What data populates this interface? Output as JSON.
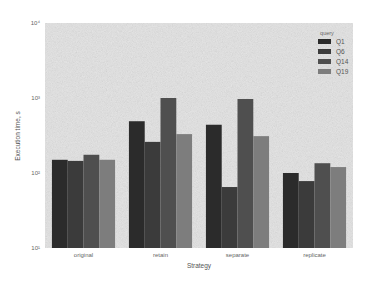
{
  "chart_data": {
    "type": "bar",
    "title": "",
    "xlabel": "Strategy",
    "ylabel": "Execution time, s",
    "yscale": "log",
    "ylim": [
      10,
      10000
    ],
    "yticks": [
      10,
      100,
      1000,
      10000
    ],
    "ytick_labels": [
      "10¹",
      "10²",
      "10³",
      "10⁴"
    ],
    "categories": [
      "original",
      "retain",
      "separate",
      "replicate"
    ],
    "legend_title": "query",
    "legend_position": "upper right",
    "grid": false,
    "series": [
      {
        "name": "Q1",
        "color": "#2b2b2b",
        "values": [
          150,
          490,
          440,
          100
        ]
      },
      {
        "name": "Q6",
        "color": "#3b3b3b",
        "values": [
          145,
          260,
          65,
          78
        ]
      },
      {
        "name": "Q14",
        "color": "#4f4f4f",
        "values": [
          175,
          1000,
          970,
          135
        ]
      },
      {
        "name": "Q19",
        "color": "#7d7d7d",
        "values": [
          150,
          330,
          310,
          120
        ]
      }
    ]
  },
  "style": {
    "plot_background": "#e6e6e6",
    "page_background": "#ffffff"
  }
}
